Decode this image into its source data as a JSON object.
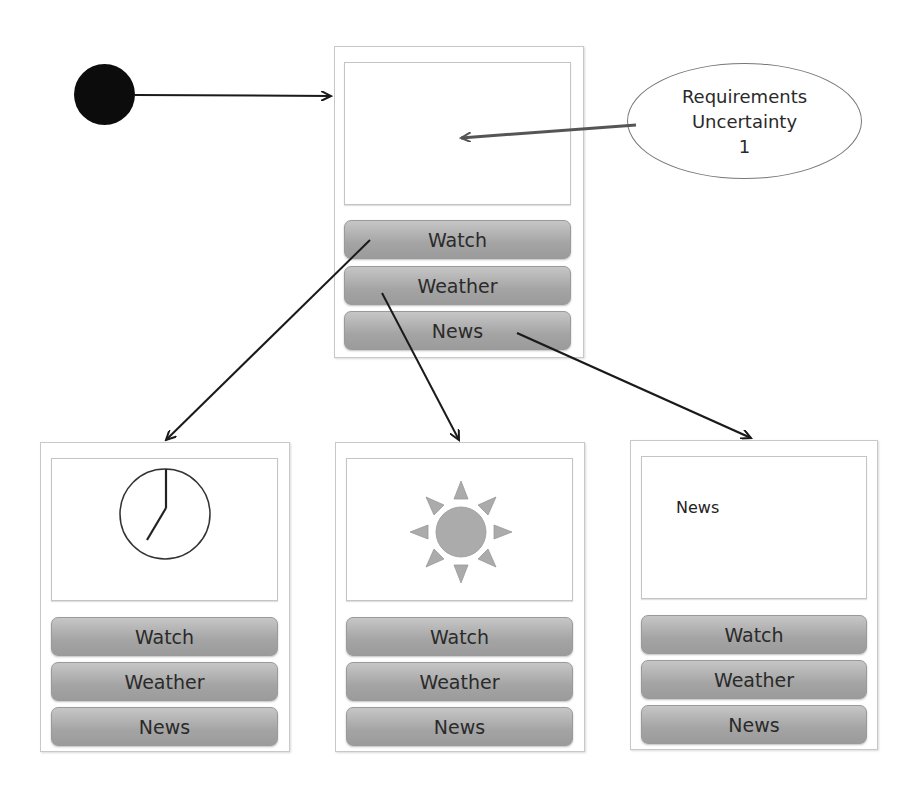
{
  "start_node": {
    "icon": "filled-circle-start-icon"
  },
  "annotation": {
    "lines": [
      "Requirements",
      "Uncertainty",
      "1"
    ]
  },
  "main_screen": {
    "content": "",
    "buttons": [
      {
        "label": "Watch"
      },
      {
        "label": "Weather"
      },
      {
        "label": "News"
      }
    ]
  },
  "screens": [
    {
      "id": "watch",
      "content_icon": "clock-icon",
      "buttons": [
        {
          "label": "Watch"
        },
        {
          "label": "Weather"
        },
        {
          "label": "News"
        }
      ]
    },
    {
      "id": "weather",
      "content_icon": "sun-icon",
      "buttons": [
        {
          "label": "Watch"
        },
        {
          "label": "Weather"
        },
        {
          "label": "News"
        }
      ]
    },
    {
      "id": "news",
      "content_text": "News",
      "buttons": [
        {
          "label": "Watch"
        },
        {
          "label": "Weather"
        },
        {
          "label": "News"
        }
      ]
    }
  ],
  "transitions": [
    {
      "from": "start",
      "to": "main_screen"
    },
    {
      "from": "annotation",
      "to": "main_screen.content"
    },
    {
      "from": "main_screen.Watch",
      "to": "screens.watch"
    },
    {
      "from": "main_screen.Weather",
      "to": "screens.weather"
    },
    {
      "from": "main_screen.News",
      "to": "screens.news"
    }
  ],
  "colors": {
    "button_fill": "#a8a8a8",
    "border": "#c8c8c8",
    "sun": "#ababab",
    "arrow": "#1a1a1a"
  }
}
